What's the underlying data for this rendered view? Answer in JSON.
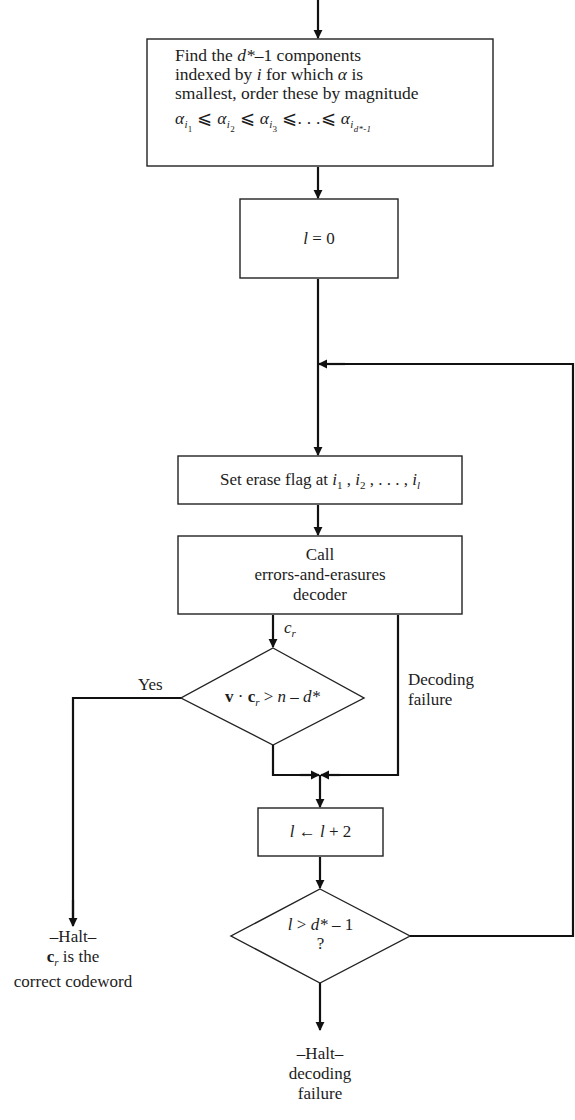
{
  "flowchart": {
    "nodes": {
      "find_components": {
        "line1_pre": "Find the ",
        "line1_var": "d*",
        "line1_post": "–1 components",
        "line2_pre": "indexed by ",
        "line2_var": "i",
        "line2_mid": " for which ",
        "line2_alpha": "α",
        "line2_post": " is",
        "line3": "smallest, order these by magnitude",
        "ordering": {
          "alpha": "α",
          "i": "i",
          "subs": [
            "1",
            "2",
            "3"
          ],
          "leq": "⩽",
          "ellipsis": ". . .",
          "last_sub": "d*-1"
        }
      },
      "init": {
        "var": "l",
        "rest": " = 0"
      },
      "set_erase": {
        "text": "Set erase flag at ",
        "i": "i",
        "subs": [
          "1",
          "2",
          "l"
        ],
        "sep": " , ",
        "ellipsis": ". . . ,"
      },
      "decoder": {
        "line1": "Call",
        "line2": "errors-and-erasures",
        "line3": "decoder"
      },
      "check_codeword": {
        "v": "v",
        "dot": " · ",
        "c": "c",
        "c_sub": "r",
        "gt": " > ",
        "rhs_n": "n",
        "minus": " – ",
        "rhs_d": "d*"
      },
      "increment": {
        "lhs": "l",
        "arrow": " ← ",
        "rhs": "l",
        "plus": " + 2"
      },
      "check_limit": {
        "lhs": "l",
        "gt": " > ",
        "rhs": "d*",
        "minus": " – 1",
        "q": "?"
      },
      "halt_success": {
        "line1": "–Halt–",
        "c": "c",
        "c_sub": "r",
        "line2_post": " is the",
        "line3": "correct codeword"
      },
      "halt_failure": {
        "line1": "–Halt–",
        "line2": "decoding",
        "line3": "failure"
      }
    },
    "edge_labels": {
      "decoder_output": {
        "c": "c",
        "sub": "r"
      },
      "yes": "Yes",
      "decoding_failure_1": "Decoding",
      "decoding_failure_2": "failure"
    }
  }
}
